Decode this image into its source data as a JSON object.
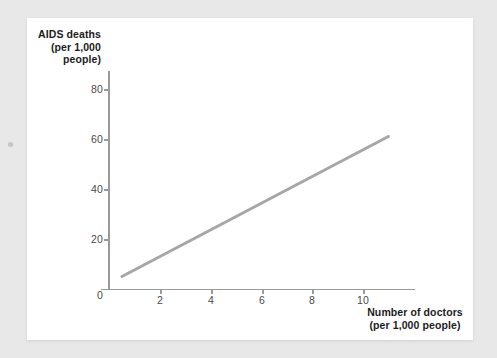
{
  "chart_data": {
    "type": "line",
    "title": "",
    "subtitle": "",
    "xlabel": "Number of doctors (per 1,000 people)",
    "ylabel": "AIDS deaths (per 1,000 people)",
    "ylabel_lines": [
      "AIDS",
      "deaths",
      "(per 1,000",
      "people)"
    ],
    "xlabel_lines": [
      "Number of doctors",
      "(per 1,000 people)"
    ],
    "xlim": [
      0,
      12
    ],
    "ylim": [
      0,
      88
    ],
    "xticks": [
      0,
      2,
      4,
      6,
      8,
      10
    ],
    "yticks": [
      0,
      20,
      40,
      60,
      80
    ],
    "xtick_labels": [
      "0",
      "2",
      "4",
      "6",
      "8",
      "10"
    ],
    "ytick_labels": [
      "0",
      "20",
      "40",
      "60",
      "80"
    ],
    "grid": false,
    "legend": false,
    "series": [
      {
        "name": "AIDS deaths vs doctors",
        "color": "#a6a6a6",
        "line_width": 3,
        "x": [
          0.5,
          11.0
        ],
        "values": [
          5,
          61
        ],
        "points": [
          [
            0.5,
            5
          ],
          [
            11.0,
            61
          ]
        ],
        "trend": "positive linear"
      }
    ]
  },
  "figure": {
    "axis_color": "#9a9a9a",
    "line_color": "#a6a6a6",
    "background": "#ffffff",
    "page_background": "#e8e8e8",
    "text_color": "#1c1c1c",
    "tick_label_color": "#4a4a4a"
  }
}
